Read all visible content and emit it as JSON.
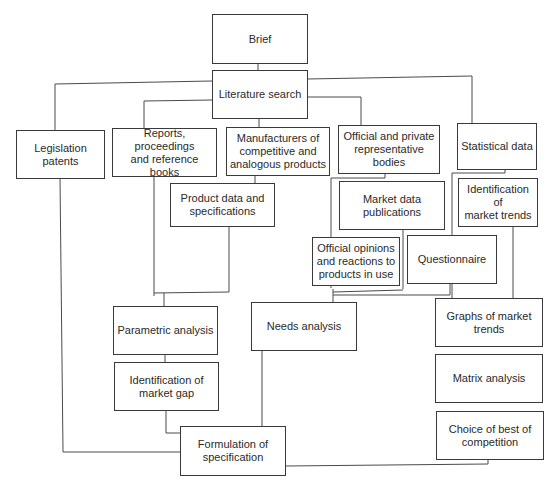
{
  "diagram": {
    "type": "flowchart",
    "nodes": {
      "brief": "Brief",
      "literature_search": "Literature search",
      "legislation_patents": "Legislation\npatents",
      "reports": "Reports, proceedings\nand reference books",
      "manufacturers": "Manufacturers of\ncompetitive and\nanalogous products",
      "official_bodies": "Official and private\nrepresentative bodies",
      "statistical_data": "Statistical data",
      "product_data": "Product data and\nspecifications",
      "market_data": "Market data\npublications",
      "identification_trends": "Identification of\nmarket trends",
      "official_opinions": "Official opinions\nand reactions to\nproducts in use",
      "questionnaire": "Questionnaire",
      "parametric_analysis": "Parametric analysis",
      "needs_analysis": "Needs analysis",
      "graphs_trends": "Graphs of market\ntrends",
      "identification_gap": "Identification of\nmarket gap",
      "matrix_analysis": "Matrix analysis",
      "formulation": "Formulation of\nspecification",
      "choice_best": "Choice of best of\ncompetition"
    },
    "edges": [
      [
        "brief",
        "literature_search"
      ],
      [
        "literature_search",
        "legislation_patents"
      ],
      [
        "literature_search",
        "reports"
      ],
      [
        "literature_search",
        "manufacturers"
      ],
      [
        "literature_search",
        "official_bodies"
      ],
      [
        "literature_search",
        "statistical_data"
      ],
      [
        "manufacturers",
        "product_data"
      ],
      [
        "official_bodies",
        "market_data"
      ],
      [
        "official_bodies",
        "official_opinions"
      ],
      [
        "statistical_data",
        "identification_trends"
      ],
      [
        "statistical_data",
        "questionnaire"
      ],
      [
        "reports",
        "parametric_analysis"
      ],
      [
        "product_data",
        "parametric_analysis"
      ],
      [
        "market_data",
        "needs_analysis"
      ],
      [
        "official_opinions",
        "needs_analysis"
      ],
      [
        "questionnaire",
        "needs_analysis"
      ],
      [
        "identification_trends",
        "graphs_trends"
      ],
      [
        "parametric_analysis",
        "identification_gap"
      ],
      [
        "graphs_trends",
        "matrix_analysis"
      ],
      [
        "matrix_analysis",
        "choice_best"
      ],
      [
        "identification_gap",
        "formulation"
      ],
      [
        "needs_analysis",
        "formulation"
      ],
      [
        "legislation_patents",
        "formulation"
      ],
      [
        "choice_best",
        "formulation"
      ]
    ]
  }
}
